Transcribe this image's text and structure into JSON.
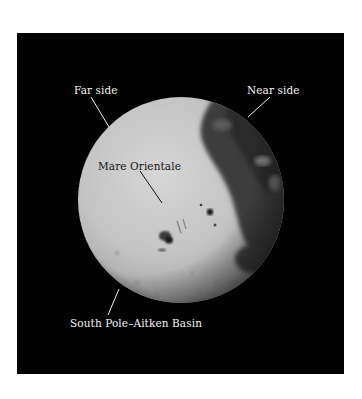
{
  "figure": {
    "background_color": "#020202",
    "moon_light_color": "#c8c8c8",
    "moon_dark_color": "#3a3a3a",
    "labels": {
      "far_side": "Far side",
      "near_side": "Near side",
      "mare_orientale": "Mare Orientale",
      "south_pole_aitken": "South Pole–Aitken Basin"
    }
  }
}
